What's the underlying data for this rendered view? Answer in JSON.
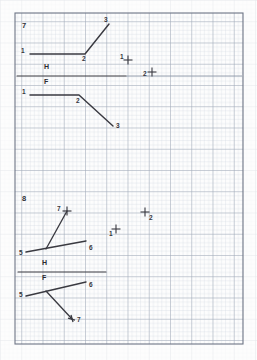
{
  "sheet": {
    "title": "Descriptive Geometry Worksheet",
    "paper_color": "#fdfdfd",
    "grid_minor_color": "#c9d2de",
    "grid_major_color": "#9aa4b4",
    "border_color": "#6e7686",
    "ink_color": "#3a3a41",
    "grid_minor_spacing_px": 4.25,
    "grid_major_spacing_px": 21.25,
    "border": {
      "x": 15,
      "y": 13,
      "width": 228,
      "height": 331
    }
  },
  "problems": [
    {
      "id": "problem-7",
      "number": "7",
      "number_pos": {
        "x": 22,
        "y": 22
      },
      "fold_line": {
        "name": "HF-fold-line",
        "x1": 17,
        "y1": 76,
        "x2": 242,
        "y2": 76,
        "dark_until_x": 126,
        "labels": [
          {
            "text": "H",
            "x": 44,
            "y": 67
          },
          {
            "text": "F",
            "x": 44,
            "y": 81
          }
        ]
      },
      "views": [
        {
          "name": "top-view-polyline",
          "view_label": "H",
          "points": [
            {
              "label": "1",
              "x": 30,
              "y": 54,
              "label_pos": {
                "x": 22,
                "y": 49
              },
              "marker": "none"
            },
            {
              "label": "2",
              "x": 85,
              "y": 54,
              "label_pos": {
                "x": 83,
                "y": 57
              },
              "marker": "none"
            },
            {
              "label": "3",
              "x": 109,
              "y": 24,
              "label_pos": {
                "x": 105,
                "y": 18
              },
              "marker": "none"
            }
          ]
        },
        {
          "name": "front-view-polyline",
          "view_label": "F",
          "points": [
            {
              "label": "1",
              "x": 30,
              "y": 95,
              "label_pos": {
                "x": 23,
                "y": 90
              },
              "marker": "none"
            },
            {
              "label": "2",
              "x": 79,
              "y": 95,
              "label_pos": {
                "x": 77,
                "y": 99
              },
              "marker": "none"
            },
            {
              "label": "3",
              "x": 113,
              "y": 126,
              "label_pos": {
                "x": 116,
                "y": 125
              },
              "marker": "none"
            }
          ]
        }
      ],
      "given_points": [
        {
          "label": "1",
          "x": 128,
          "y": 60,
          "label_pos": {
            "x": 121,
            "y": 57
          },
          "marker": "plus"
        },
        {
          "label": "2",
          "x": 152,
          "y": 72,
          "label_pos": {
            "x": 144,
            "y": 74
          },
          "marker": "plus"
        }
      ]
    },
    {
      "id": "problem-8",
      "number": "8",
      "number_pos": {
        "x": 22,
        "y": 196
      },
      "fold_line": {
        "name": "HF-fold-line",
        "x1": 18,
        "y1": 272,
        "x2": 106,
        "y2": 272,
        "dark_until_x": 106,
        "labels": [
          {
            "text": "H",
            "x": 42,
            "y": 263
          },
          {
            "text": "F",
            "x": 42,
            "y": 277
          }
        ]
      },
      "views": [
        {
          "name": "top-view-lines",
          "view_label": "H",
          "vertex": {
            "x": 46,
            "y": 249
          },
          "points": [
            {
              "label": "5",
              "x": 26,
              "y": 252,
              "label_pos": {
                "x": 20,
                "y": 252
              },
              "marker": "none"
            },
            {
              "label": "6",
              "x": 86,
              "y": 241,
              "label_pos": {
                "x": 89,
                "y": 248
              },
              "marker": "none"
            },
            {
              "label": "7",
              "x": 67,
              "y": 211,
              "label_pos": {
                "x": 59,
                "y": 208
              },
              "marker": "plus"
            }
          ]
        },
        {
          "name": "front-view-lines",
          "view_label": "F",
          "vertex": {
            "x": 46,
            "y": 291
          },
          "points": [
            {
              "label": "5",
              "x": 26,
              "y": 296,
              "label_pos": {
                "x": 20,
                "y": 294
              },
              "marker": "none"
            },
            {
              "label": "6",
              "x": 86,
              "y": 282,
              "label_pos": {
                "x": 89,
                "y": 285
              },
              "marker": "none"
            },
            {
              "label": "7",
              "x": 72,
              "y": 319,
              "label_pos": {
                "x": 76,
                "y": 320
              },
              "marker": "arrow"
            }
          ]
        }
      ],
      "given_points": [
        {
          "label": "1",
          "x": 116,
          "y": 229,
          "label_pos": {
            "x": 110,
            "y": 234
          },
          "marker": "plus"
        },
        {
          "label": "2",
          "x": 145,
          "y": 212,
          "label_pos": {
            "x": 149,
            "y": 218
          },
          "marker": "plus"
        }
      ]
    }
  ]
}
